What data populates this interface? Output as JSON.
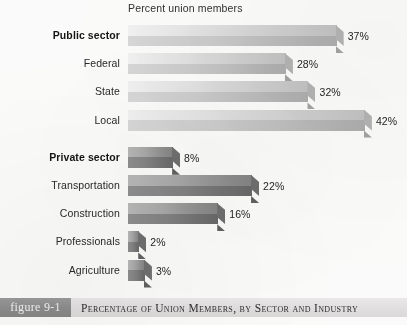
{
  "chart_data": {
    "type": "bar",
    "orientation": "horizontal",
    "title": "Percent union members",
    "xlabel": "",
    "ylabel": "",
    "xlim": [
      0,
      45
    ],
    "grid": false,
    "legend": "none",
    "categories": [
      "Public sector",
      "Federal",
      "State",
      "Local",
      "Private sector",
      "Transportation",
      "Construction",
      "Professionals",
      "Agriculture"
    ],
    "values": [
      37,
      28,
      32,
      42,
      8,
      22,
      16,
      2,
      3
    ],
    "data_labels": [
      "37%",
      "28%",
      "32%",
      "42%",
      "8%",
      "22%",
      "16%",
      "2%",
      "3%"
    ],
    "bars": [
      {
        "label": "Public sector",
        "value": 37,
        "data_label": "37%",
        "emphasis": "bold",
        "shade": "light"
      },
      {
        "label": "Federal",
        "value": 28,
        "data_label": "28%",
        "emphasis": "normal",
        "shade": "light"
      },
      {
        "label": "State",
        "value": 32,
        "data_label": "32%",
        "emphasis": "normal",
        "shade": "light"
      },
      {
        "label": "Local",
        "value": 42,
        "data_label": "42%",
        "emphasis": "normal",
        "shade": "light"
      },
      {
        "label": "Private sector",
        "value": 8,
        "data_label": "8%",
        "emphasis": "bold",
        "shade": "dark"
      },
      {
        "label": "Transportation",
        "value": 22,
        "data_label": "22%",
        "emphasis": "normal",
        "shade": "dark"
      },
      {
        "label": "Construction",
        "value": 16,
        "data_label": "16%",
        "emphasis": "normal",
        "shade": "dark"
      },
      {
        "label": "Professionals",
        "value": 2,
        "data_label": "2%",
        "emphasis": "normal",
        "shade": "dark"
      },
      {
        "label": "Agriculture",
        "value": 3,
        "data_label": "3%",
        "emphasis": "normal",
        "shade": "dark"
      }
    ],
    "colors": {
      "light_bar_top": "#e2e2e2",
      "light_bar_front": "#cbcbcb",
      "dark_bar_top": "#a7a7a7",
      "dark_bar_front": "#818181",
      "label_text": "#262626",
      "background": "#fdfdfc"
    }
  },
  "caption": {
    "figure_tag": "figure 9-1",
    "text": "Percentage of Union Members, by Sector and Industry"
  }
}
